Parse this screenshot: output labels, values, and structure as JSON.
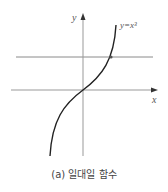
{
  "figure": {
    "caption": "(a) 일대일 함수",
    "function_label": "y=x³",
    "x_axis_label": "x",
    "y_axis_label": "y",
    "colors": {
      "axis": "#999999",
      "curve": "#222222",
      "horizontal_line": "#888888",
      "text": "#555555"
    }
  }
}
